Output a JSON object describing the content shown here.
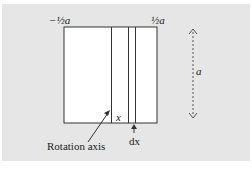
{
  "diagram": {
    "labels": {
      "left_bound": "−½a",
      "right_bound": "½a",
      "height": "a",
      "strip_position": "x",
      "strip_width": "dx",
      "rotation_axis": "Rotation axis"
    },
    "colors": {
      "panel_background": "#e6e6e6",
      "square_fill": "#ffffff",
      "line": "#333333"
    }
  },
  "caption": {
    "text": ""
  }
}
